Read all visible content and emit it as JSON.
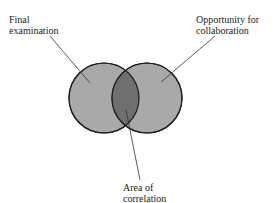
{
  "diagram": {
    "type": "venn",
    "labels": {
      "left": [
        "Final",
        "examination"
      ],
      "right": [
        "Opportunity for",
        "collaboration"
      ],
      "intersection": [
        "Area of",
        "correlation"
      ]
    },
    "colors": {
      "circle_fill": "#a9a9a9",
      "intersection_fill": "#6f6f6f",
      "stroke": "#1e1e1e"
    }
  }
}
